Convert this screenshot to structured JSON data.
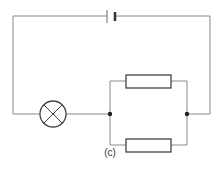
{
  "diagram": {
    "type": "circuit",
    "caption": "(c)",
    "components": [
      {
        "id": "cell",
        "kind": "cell",
        "position": "top wire, center"
      },
      {
        "id": "lamp",
        "kind": "lamp",
        "position": "bottom-left wire"
      },
      {
        "id": "resistor-top",
        "kind": "resistor",
        "position": "upper parallel branch"
      },
      {
        "id": "resistor-bottom",
        "kind": "resistor",
        "position": "lower parallel branch"
      },
      {
        "id": "junction-left",
        "kind": "junction"
      },
      {
        "id": "junction-right",
        "kind": "junction"
      }
    ],
    "topology": "cell in series with lamp and a parallel pair of resistors",
    "colors": {
      "wire": "#8a8a8a",
      "component": "#444444",
      "background": "#ffffff"
    }
  }
}
